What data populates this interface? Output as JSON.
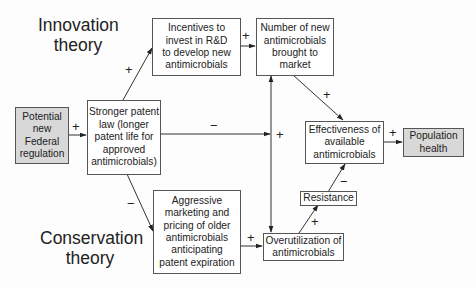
{
  "diagram": {
    "type": "causal-loop",
    "labels": {
      "innovation_theory": [
        "Innovation",
        "theory"
      ],
      "conservation_theory": [
        "Conservation",
        "theory"
      ]
    },
    "nodes": {
      "potential_regulation": {
        "lines": [
          "Potential",
          "new",
          "Federal",
          "regulation"
        ],
        "shaded": true
      },
      "stronger_patent": {
        "lines": [
          "Stronger patent",
          "law (longer",
          "patent life for",
          "approved",
          "antimicrobials)"
        ],
        "shaded": false
      },
      "incentives": {
        "lines": [
          "Incentives to",
          "invest in R&D",
          "to develop new",
          "antimicrobials"
        ],
        "shaded": false
      },
      "new_antimicrobials": {
        "lines": [
          "Number of new",
          "antimicrobials",
          "brought to",
          "market"
        ],
        "shaded": false
      },
      "effectiveness": {
        "lines": [
          "Effectiveness of",
          "available",
          "antimicrobials"
        ],
        "shaded": false
      },
      "population_health": {
        "lines": [
          "Population",
          "health"
        ],
        "shaded": true
      },
      "resistance": {
        "lines": [
          "Resistance"
        ],
        "shaded": false
      },
      "aggressive_marketing": {
        "lines": [
          "Aggressive",
          "marketing and",
          "pricing of older",
          "antimicrobials",
          "anticipating",
          "patent expiration"
        ],
        "shaded": false
      },
      "overutilization": {
        "lines": [
          "Overutilization of",
          "antimicrobials"
        ],
        "shaded": false
      }
    },
    "signs": {
      "regulation_to_patent": "+",
      "patent_to_incentives": "+",
      "incentives_to_new": "+",
      "patent_to_effectiveness": "−",
      "vertical_to_effectiveness": "+",
      "new_to_effectiveness": "+",
      "effectiveness_to_health": "+",
      "patent_to_marketing": "−",
      "marketing_to_overutilization": "+",
      "overutilization_to_resistance": "+",
      "resistance_to_effectiveness": "−"
    },
    "edges": [
      {
        "from": "Potential new Federal regulation",
        "to": "Stronger patent law",
        "sign": "+"
      },
      {
        "from": "Stronger patent law",
        "to": "Incentives to invest in R&D",
        "sign": "+"
      },
      {
        "from": "Incentives to invest in R&D",
        "to": "Number of new antimicrobials",
        "sign": "+"
      },
      {
        "from": "Stronger patent law",
        "to": "Effectiveness of available antimicrobials",
        "sign": "−"
      },
      {
        "from": "Number of new antimicrobials",
        "to": "Effectiveness of available antimicrobials",
        "sign": "+"
      },
      {
        "from": "Effectiveness of available antimicrobials",
        "to": "Population health",
        "sign": "+"
      },
      {
        "from": "Stronger patent law",
        "to": "Aggressive marketing and pricing",
        "sign": "−"
      },
      {
        "from": "Aggressive marketing and pricing",
        "to": "Overutilization of antimicrobials",
        "sign": "+"
      },
      {
        "from": "Overutilization of antimicrobials",
        "to": "Number of new antimicrobials",
        "sign": ""
      },
      {
        "from": "Number of new antimicrobials",
        "to": "Overutilization of antimicrobials",
        "sign": ""
      },
      {
        "from": "Overutilization of antimicrobials",
        "to": "Resistance",
        "sign": "+"
      },
      {
        "from": "Resistance",
        "to": "Effectiveness of available antimicrobials",
        "sign": "−"
      }
    ]
  }
}
